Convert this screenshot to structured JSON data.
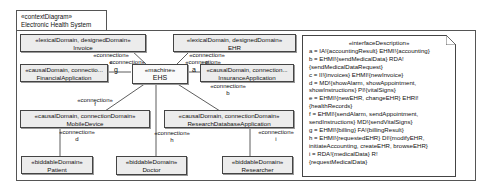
{
  "frame": {
    "stereotype": "«contextDiagram»",
    "title": "Electronic Health System"
  },
  "domains": {
    "invoice": {
      "stereotype": "«lexicalDomain, designedDomain»",
      "name": "Invoice"
    },
    "ehr": {
      "stereotype": "«lexicalDomain, designedDomain»",
      "name": "EHR"
    },
    "financial": {
      "stereotype": "«causalDomain, connectio...",
      "name": "FinancialApplication"
    },
    "ehs": {
      "stereotype": "«machine»",
      "name": "EHS"
    },
    "insurance": {
      "stereotype": "«causalDomain, connection...",
      "name": "InsuranceApplication"
    },
    "mobile": {
      "stereotype": "«causalDomain, connectionDomain»",
      "name": "MobileDevice"
    },
    "research_db": {
      "stereotype": "«causalDomain, connectionDomain»",
      "name": "ResearchDatabaseApplication"
    },
    "patient": {
      "stereotype": "«biddableDomain»",
      "name": "Patient"
    },
    "doctor": {
      "stereotype": "«biddableDomain»",
      "name": "Doctor"
    },
    "researcher": {
      "stereotype": "«biddableDomain»",
      "name": "Researcher"
    }
  },
  "connections": {
    "c": {
      "stereotype": "«connection»",
      "name": "c"
    },
    "g": {
      "stereotype": "«connection»",
      "name": "g"
    },
    "e": {
      "stereotype": "«connection»",
      "name": "e"
    },
    "a": {
      "stereotype": "«connection»",
      "name": "a"
    },
    "b": {
      "stereotype": "«connection»",
      "name": "b"
    },
    "f": {
      "stereotype": "«connection»",
      "name": "f"
    },
    "d": {
      "stereotype": "«connection»",
      "name": "d"
    },
    "h": {
      "stereotype": "«connection»",
      "name": "h"
    },
    "i": {
      "stereotype": "«connection»",
      "name": "i"
    }
  },
  "interface_description": {
    "stereotype": "«interfaceDescription»",
    "lines": [
      "a = IA!{accountingResult} EHMI!{accounting}",
      "b = EHMI!{sendMedicalData} RDA!",
      "{sendMedicalDataRequest}",
      "c = II!{invoices} EHMI!{newInvoice}",
      "d = MD!{showAlarm, showAppointment,",
      "showInstructions} PI!{vitalSigns}",
      "e = EHMI!{newEHR, changeEHR} EHRI!",
      "{healthRecords}",
      "f = EHMI!{sendAlarm, sendAppointment,",
      "sendInstructions} MD!{sendVitalSigns}",
      "g = EHMI!{billing} FA!{billingResult}",
      "h = EHMI!{requestedEHR} DI!{modifyEHR,",
      "initiateAccounting, createEHR, browseEHR}",
      "i = RDA!{medicalData} R!",
      "{requestMedicalData}"
    ]
  }
}
